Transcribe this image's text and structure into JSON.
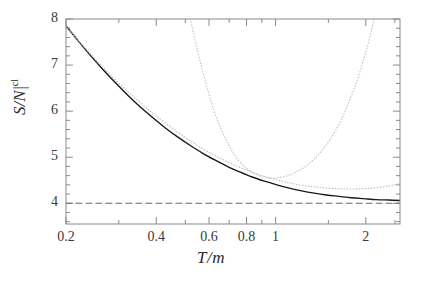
{
  "chart_data": {
    "type": "line",
    "title": "",
    "xlabel": "T/m",
    "ylabel": "S/N |cl",
    "ylabel_parts": {
      "main": "S/N",
      "bar": "|",
      "superscript": "cl"
    },
    "xscale": "log",
    "yscale": "linear",
    "xlim": [
      0.2,
      2.6
    ],
    "ylim": [
      3.55,
      8.0
    ],
    "grid": false,
    "legend": null,
    "xticks_major": [
      0.2,
      0.4,
      0.6,
      0.8,
      1,
      2
    ],
    "xticklabels": [
      "0.2",
      "0.4",
      "0.6",
      "0.8",
      "1",
      "2"
    ],
    "xticks_minor": [
      0.3,
      0.5,
      0.7,
      0.9,
      1.5,
      2.5
    ],
    "yticks_major": [
      4,
      5,
      6,
      7,
      8
    ],
    "yticklabels": [
      "4",
      "5",
      "6",
      "7",
      "8"
    ],
    "yticks_minor": [
      3.6,
      3.8,
      4.2,
      4.4,
      4.6,
      4.8,
      5.2,
      5.4,
      5.6,
      5.8,
      6.2,
      6.4,
      6.6,
      6.8,
      7.2,
      7.4,
      7.6,
      7.8
    ],
    "series": [
      {
        "name": "exact",
        "style": "solid",
        "color": "#1a1a1a",
        "width": 1.4,
        "x": [
          0.2,
          0.22,
          0.242,
          0.266,
          0.293,
          0.322,
          0.354,
          0.389,
          0.428,
          0.471,
          0.518,
          0.57,
          0.627,
          0.69,
          0.759,
          0.835,
          0.918,
          1.01,
          1.111,
          1.222,
          1.345,
          1.479,
          1.627,
          1.79,
          1.969,
          2.166,
          2.383,
          2.6
        ],
        "y": [
          7.85,
          7.52,
          7.2,
          6.9,
          6.61,
          6.34,
          6.09,
          5.86,
          5.64,
          5.44,
          5.26,
          5.09,
          4.94,
          4.8,
          4.68,
          4.57,
          4.48,
          4.4,
          4.33,
          4.27,
          4.22,
          4.18,
          4.15,
          4.12,
          4.1,
          4.08,
          4.07,
          4.06
        ]
      },
      {
        "name": "low-T expansion",
        "style": "dotted",
        "color": "#c8bfb4",
        "width": 1.2,
        "x": [
          0.2,
          0.24,
          0.29,
          0.35,
          0.42,
          0.5,
          0.59,
          0.69,
          0.8,
          0.92,
          1.05,
          1.2,
          1.38,
          1.58,
          1.82,
          2.1,
          2.4,
          2.6
        ],
        "y": [
          7.84,
          7.26,
          6.7,
          6.21,
          5.79,
          5.43,
          5.13,
          4.9,
          4.72,
          4.58,
          4.48,
          4.4,
          4.35,
          4.32,
          4.31,
          4.33,
          4.38,
          4.43
        ]
      },
      {
        "name": "high-T expansion",
        "style": "dotted",
        "color": "#ccc3b8",
        "width": 1.2,
        "x": [
          0.52,
          0.545,
          0.575,
          0.61,
          0.65,
          0.7,
          0.755,
          0.815,
          0.88,
          0.95,
          1.03,
          1.12,
          1.22,
          1.33,
          1.45,
          1.58,
          1.72,
          1.86,
          1.98,
          2.07,
          2.13
        ],
        "y": [
          8.0,
          7.4,
          6.8,
          6.2,
          5.7,
          5.25,
          4.92,
          4.72,
          4.6,
          4.55,
          4.56,
          4.62,
          4.74,
          4.93,
          5.2,
          5.56,
          6.05,
          6.62,
          7.18,
          7.65,
          8.0
        ]
      },
      {
        "name": "classical limit",
        "style": "dashed",
        "color": "#6a6a6a",
        "width": 1.1,
        "constant_y": 4,
        "x": [
          0.2,
          2.6
        ],
        "y": [
          4,
          4
        ]
      }
    ],
    "annotations": []
  },
  "frame": {
    "left_px": 66,
    "right_px": 400,
    "top_px": 19,
    "bottom_px": 224,
    "border_color": "#8a8a8a"
  },
  "colors": {
    "background": "#ffffff",
    "frame": "#8a8a8a",
    "text": "#2b2b2b",
    "solid_curve": "#1a1a1a",
    "dotted_curve": "#c8bfb4",
    "dashed_line": "#6a6a6a"
  }
}
